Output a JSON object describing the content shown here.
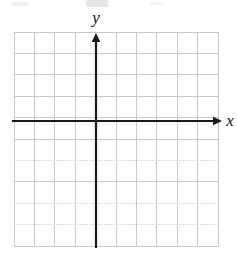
{
  "figure": {
    "kind": "cartesian-coordinate-grid",
    "background_color": "#ffffff"
  },
  "grid": {
    "left": 14,
    "top": 32,
    "right": 218,
    "bottom": 246,
    "columns": 10,
    "rows": 10,
    "cell_width": 20.4,
    "cell_height": 21.4,
    "line_color": "#c9c9c9",
    "faded_line_color": "#dddddd",
    "line_width": 1,
    "vertical_lines_x": [
      14,
      34.4,
      54.8,
      75.2,
      95.6,
      116,
      136.4,
      156.8,
      177.2,
      197.6,
      218
    ],
    "horizontal_lines_y": [
      32,
      53.4,
      74.8,
      96.2,
      117.6,
      139,
      160.4,
      181.8,
      203.2,
      224.6,
      246
    ],
    "faded_horizontal_rows": [
      6,
      8,
      9
    ],
    "show_tick_numbers": false
  },
  "axes": {
    "color": "#1a1a1a",
    "line_width": 2.2,
    "origin": {
      "x": 96,
      "y": 121
    },
    "x_axis": {
      "label": "x",
      "label_x": 230,
      "label_y": 126,
      "start_x": 12,
      "end_x": 222,
      "y": 121,
      "arrow": "right",
      "arrow_size": 7
    },
    "y_axis": {
      "label": "y",
      "label_x": 96,
      "label_y": 23,
      "x": 96,
      "start_y": 248,
      "end_y": 33,
      "arrow": "up",
      "arrow_size": 7
    }
  },
  "artifacts": {
    "top_smudges": [
      {
        "x": 12,
        "y": 2,
        "width": 16,
        "height": 4,
        "opacity": 0.25
      },
      {
        "x": 86,
        "y": 0,
        "width": 22,
        "height": 7,
        "opacity": 0.45
      },
      {
        "x": 150,
        "y": 2,
        "width": 14,
        "height": 3,
        "opacity": 0.2
      }
    ]
  }
}
